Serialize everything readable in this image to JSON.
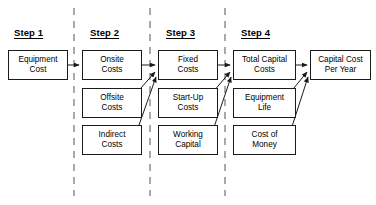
{
  "diagram": {
    "steps": [
      {
        "id": "step1",
        "label": "Step 1",
        "x": 14,
        "y": 27
      },
      {
        "id": "step2",
        "label": "Step 2",
        "x": 90,
        "y": 27
      },
      {
        "id": "step3",
        "label": "Step 3",
        "x": 166,
        "y": 27
      },
      {
        "id": "step4",
        "label": "Step 4",
        "x": 241,
        "y": 27
      }
    ],
    "nodes": [
      {
        "id": "equipment-cost",
        "label": "Equipment\nCost",
        "line1": "Equipment",
        "line2": "Cost",
        "x": 8,
        "y": 50,
        "w": 60,
        "h": 30
      },
      {
        "id": "onsite-costs",
        "label": "Onsite\nCosts",
        "line1": "Onsite",
        "line2": "Costs",
        "x": 82,
        "y": 50,
        "w": 60,
        "h": 30
      },
      {
        "id": "offsite-costs",
        "label": "Offsite\nCosts",
        "line1": "Offsite",
        "line2": "Costs",
        "x": 82,
        "y": 88,
        "w": 60,
        "h": 30
      },
      {
        "id": "indirect-costs",
        "label": "Indirect\nCosts",
        "line1": "Indirect",
        "line2": "Costs",
        "x": 82,
        "y": 125,
        "w": 60,
        "h": 30
      },
      {
        "id": "fixed-costs",
        "label": "Fixed\nCosts",
        "line1": "Fixed",
        "line2": "Costs",
        "x": 158,
        "y": 50,
        "w": 60,
        "h": 30
      },
      {
        "id": "start-up-costs",
        "label": "Start-Up\nCosts",
        "line1": "Start-Up",
        "line2": "Costs",
        "x": 158,
        "y": 88,
        "w": 60,
        "h": 30
      },
      {
        "id": "working-capital",
        "label": "Working\nCapital",
        "line1": "Working",
        "line2": "Capital",
        "x": 158,
        "y": 125,
        "w": 60,
        "h": 30
      },
      {
        "id": "total-capital-costs",
        "label": "Total Capital\nCosts",
        "line1": "Total Capital",
        "line2": "Costs",
        "x": 233,
        "y": 50,
        "w": 63,
        "h": 30
      },
      {
        "id": "equipment-life",
        "label": "Equipment\nLife",
        "line1": "Equipment",
        "line2": "Life",
        "x": 233,
        "y": 88,
        "w": 63,
        "h": 30
      },
      {
        "id": "cost-of-money",
        "label": "Cost of\nMoney",
        "line1": "Cost of",
        "line2": "Money",
        "x": 233,
        "y": 125,
        "w": 63,
        "h": 30
      },
      {
        "id": "capital-cost-per-year",
        "label": "Capital Cost\nPer Year",
        "line1": "Capital Cost",
        "line2": "Per Year",
        "x": 310,
        "y": 50,
        "w": 61,
        "h": 30
      }
    ],
    "dividers": [
      {
        "id": "divider-1",
        "x": 74,
        "y1": 8,
        "y2": 196
      },
      {
        "id": "divider-2",
        "x": 150,
        "y1": 8,
        "y2": 196
      },
      {
        "id": "divider-3",
        "x": 225,
        "y1": 8,
        "y2": 196
      }
    ],
    "connections": [
      {
        "id": "equipment-cost-to-onsite-costs",
        "from": "equipment-cost",
        "to": "onsite-costs",
        "type": "straight",
        "x1": 68,
        "y1": 65,
        "x2": 80,
        "y2": 65
      },
      {
        "id": "onsite-costs-to-fixed-costs",
        "from": "onsite-costs",
        "to": "fixed-costs",
        "type": "straight",
        "x1": 142,
        "y1": 65,
        "x2": 156,
        "y2": 65
      },
      {
        "id": "offsite-costs-to-fixed-costs",
        "from": "offsite-costs",
        "to": "fixed-costs",
        "type": "diagonal",
        "x1": 126,
        "y1": 105,
        "x2": 156,
        "y2": 72
      },
      {
        "id": "indirect-costs-to-fixed-costs",
        "from": "indirect-costs",
        "to": "fixed-costs",
        "type": "diagonal",
        "x1": 133,
        "y1": 142,
        "x2": 157,
        "y2": 76
      },
      {
        "id": "fixed-costs-to-total-capital-costs",
        "from": "fixed-costs",
        "to": "total-capital-costs",
        "type": "straight",
        "x1": 218,
        "y1": 65,
        "x2": 231,
        "y2": 65
      },
      {
        "id": "start-up-costs-to-total-capital-costs",
        "from": "start-up-costs",
        "to": "total-capital-costs",
        "type": "diagonal",
        "x1": 202,
        "y1": 105,
        "x2": 231,
        "y2": 72
      },
      {
        "id": "working-capital-to-total-capital-costs",
        "from": "working-capital",
        "to": "total-capital-costs",
        "type": "diagonal",
        "x1": 209,
        "y1": 142,
        "x2": 232,
        "y2": 76
      },
      {
        "id": "total-capital-costs-to-capital-cost",
        "from": "total-capital-costs",
        "to": "capital-cost-per-year",
        "type": "straight",
        "x1": 296,
        "y1": 65,
        "x2": 308,
        "y2": 65
      },
      {
        "id": "equipment-life-to-capital-cost",
        "from": "equipment-life",
        "to": "capital-cost-per-year",
        "type": "diagonal",
        "x1": 280,
        "y1": 105,
        "x2": 308,
        "y2": 72
      },
      {
        "id": "cost-of-money-to-capital-cost",
        "from": "cost-of-money",
        "to": "capital-cost-per-year",
        "type": "diagonal",
        "x1": 287,
        "y1": 142,
        "x2": 309,
        "y2": 76
      }
    ],
    "colors": {
      "stroke": "#1a1a1a",
      "divider": "#555555",
      "background": "#ffffff",
      "text": "#000000"
    }
  }
}
